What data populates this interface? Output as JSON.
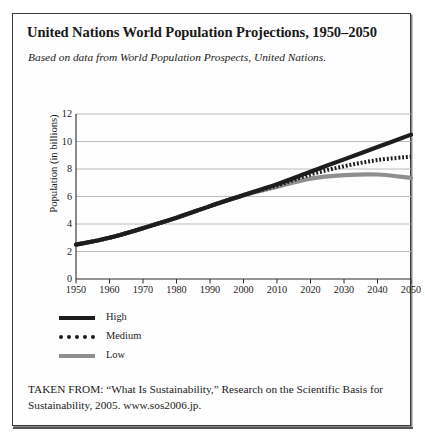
{
  "figure": {
    "title": "United Nations World Population Projections, 1950–2050",
    "subtitle": "Based on data from World Population Prospects, United Nations.",
    "source": "TAKEN FROM: “What Is Sustainability,” Research on the Scientific Basis for Sustainability, 2005. www.sos2006.jp."
  },
  "legend": {
    "position": "below-plot",
    "items": [
      {
        "label": "High",
        "key": "high",
        "color": "#1d1d1d",
        "style": "solid"
      },
      {
        "label": "Medium",
        "key": "medium",
        "color": "#1d1d1d",
        "style": "dotted"
      },
      {
        "label": "Low",
        "key": "low",
        "color": "#8e8e8e",
        "style": "solid"
      }
    ]
  },
  "chart_data": {
    "type": "line",
    "title": "United Nations World Population Projections, 1950–2050",
    "subtitle": "Based on data from World Population Prospects, United Nations.",
    "xlabel": "",
    "ylabel": "Population (in billions)",
    "xlim": [
      1950,
      2050
    ],
    "ylim": [
      0,
      12
    ],
    "xticks": [
      1950,
      1960,
      1970,
      1980,
      1990,
      2000,
      2010,
      2020,
      2030,
      2040,
      2050
    ],
    "yticks": [
      0,
      2,
      4,
      6,
      8,
      10,
      12
    ],
    "xtick_labels": [
      "1950",
      "1960",
      "1970",
      "1980",
      "1990",
      "2000",
      "2010",
      "2020",
      "2030",
      "2040",
      "2050"
    ],
    "ytick_labels": [
      "0",
      "2",
      "4",
      "6",
      "8",
      "10",
      "12"
    ],
    "grid": "horizontal",
    "legend_position": "below-plot",
    "x": [
      1950,
      1960,
      1970,
      1980,
      1990,
      2000,
      2005,
      2010,
      2020,
      2030,
      2040,
      2050
    ],
    "series": [
      {
        "name": "High",
        "color": "#1d1d1d",
        "style": "solid",
        "values": [
          2.5,
          3.0,
          3.7,
          4.45,
          5.3,
          6.1,
          6.5,
          6.9,
          7.8,
          8.7,
          9.6,
          10.5
        ]
      },
      {
        "name": "Medium",
        "color": "#1d1d1d",
        "style": "dotted",
        "values": [
          2.5,
          3.0,
          3.7,
          4.45,
          5.3,
          6.1,
          6.45,
          6.8,
          7.6,
          8.2,
          8.65,
          8.9
        ]
      },
      {
        "name": "Low",
        "color": "#8e8e8e",
        "style": "solid",
        "values": [
          2.5,
          3.0,
          3.7,
          4.45,
          5.3,
          6.1,
          6.4,
          6.7,
          7.3,
          7.55,
          7.6,
          7.35
        ]
      }
    ]
  }
}
